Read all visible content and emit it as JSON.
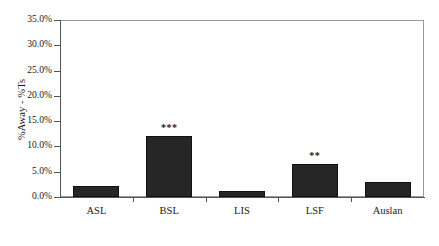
{
  "chart_data": {
    "type": "bar",
    "title": "",
    "subtitle": "",
    "xlabel": "",
    "ylabel": "%Away - %Ts",
    "categories": [
      "ASL",
      "BSL",
      "LIS",
      "LSF",
      "Auslan"
    ],
    "values": [
      2.1,
      12.0,
      1.2,
      6.5,
      3.0
    ],
    "annotations": [
      "",
      "***",
      "",
      "**",
      ""
    ],
    "ylim": [
      0,
      35
    ],
    "ytick_values": [
      0,
      5,
      10,
      15,
      20,
      25,
      30,
      35
    ],
    "ytick_labels": [
      "0.0%",
      "5.0%",
      "10.0%",
      "15.0%",
      "20.0%",
      "25.0%",
      "30.0%",
      "35.0%"
    ],
    "grid": false,
    "legend": null,
    "bar_color": "#262626",
    "axis_color": "#555555",
    "frame_color": "#9a9a9a"
  }
}
